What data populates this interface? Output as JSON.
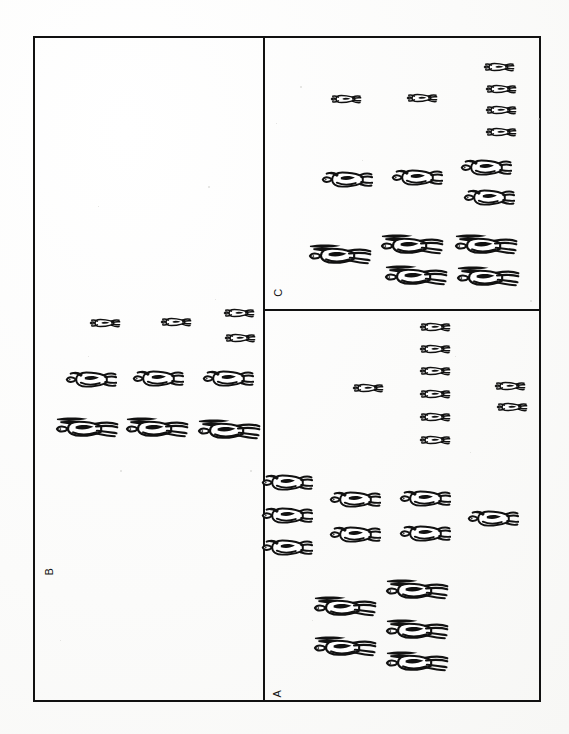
{
  "figure": {
    "background_color": "#fdfdfd",
    "ink_color": "#111111",
    "frame": {
      "x": 33,
      "y": 36,
      "width": 508,
      "height": 666,
      "stroke_width": 2
    },
    "dividers": [
      {
        "name": "vertical-divider",
        "orientation": "vertical",
        "x": 263,
        "y": 36,
        "length": 666
      },
      {
        "name": "horizontal-divider",
        "orientation": "horizontal",
        "x": 263,
        "y": 309,
        "length": 278
      }
    ]
  },
  "panels": [
    {
      "id": "B",
      "label": "B",
      "label_rotation": -90,
      "label_position": {
        "x": 46,
        "y": 566
      },
      "bounds": {
        "x": 33,
        "y": 36,
        "width": 230,
        "height": 666
      }
    },
    {
      "id": "C",
      "label": "C",
      "label_rotation": -90,
      "label_position": {
        "x": 274,
        "y": 287
      },
      "bounds": {
        "x": 263,
        "y": 36,
        "width": 278,
        "height": 273
      }
    },
    {
      "id": "A",
      "label": "A",
      "label_rotation": -90,
      "label_position": {
        "x": 274,
        "y": 688
      },
      "bounds": {
        "x": 263,
        "y": 309,
        "width": 278,
        "height": 393
      }
    }
  ],
  "size_classes": [
    {
      "name": "small",
      "description": "small juvenile hare, top view, short ears",
      "scale": 0.52
    },
    {
      "name": "medium",
      "description": "medium subadult hare, top view, rounded body",
      "scale": 0.82
    },
    {
      "name": "large",
      "description": "large adult hare, top view, long dark ears",
      "scale": 1.0
    }
  ],
  "animals": [
    {
      "panel": "C",
      "size": "small",
      "x": 345,
      "y": 99,
      "flip": false
    },
    {
      "panel": "C",
      "size": "small",
      "x": 421,
      "y": 98,
      "flip": false
    },
    {
      "panel": "C",
      "size": "small",
      "x": 498,
      "y": 67,
      "flip": false
    },
    {
      "panel": "C",
      "size": "small",
      "x": 500,
      "y": 89,
      "flip": false
    },
    {
      "panel": "C",
      "size": "small",
      "x": 500,
      "y": 110,
      "flip": false
    },
    {
      "panel": "C",
      "size": "small",
      "x": 500,
      "y": 132,
      "flip": false
    },
    {
      "panel": "C",
      "size": "medium",
      "x": 345,
      "y": 180,
      "flip": false
    },
    {
      "panel": "C",
      "size": "medium",
      "x": 415,
      "y": 178,
      "flip": false
    },
    {
      "panel": "C",
      "size": "medium",
      "x": 484,
      "y": 168,
      "flip": false
    },
    {
      "panel": "C",
      "size": "medium",
      "x": 487,
      "y": 198,
      "flip": false
    },
    {
      "panel": "C",
      "size": "large",
      "x": 338,
      "y": 253,
      "flip": false
    },
    {
      "panel": "C",
      "size": "large",
      "x": 410,
      "y": 243,
      "flip": false
    },
    {
      "panel": "C",
      "size": "large",
      "x": 414,
      "y": 274,
      "flip": false
    },
    {
      "panel": "C",
      "size": "large",
      "x": 484,
      "y": 243,
      "flip": false
    },
    {
      "panel": "C",
      "size": "large",
      "x": 486,
      "y": 275,
      "flip": false
    },
    {
      "panel": "A",
      "size": "small",
      "x": 434,
      "y": 327,
      "flip": false
    },
    {
      "panel": "A",
      "size": "small",
      "x": 434,
      "y": 349,
      "flip": false
    },
    {
      "panel": "A",
      "size": "small",
      "x": 434,
      "y": 371,
      "flip": false
    },
    {
      "panel": "A",
      "size": "small",
      "x": 434,
      "y": 394,
      "flip": false
    },
    {
      "panel": "A",
      "size": "small",
      "x": 434,
      "y": 417,
      "flip": false
    },
    {
      "panel": "A",
      "size": "small",
      "x": 434,
      "y": 440,
      "flip": false
    },
    {
      "panel": "A",
      "size": "small",
      "x": 367,
      "y": 388,
      "flip": false
    },
    {
      "panel": "A",
      "size": "small",
      "x": 509,
      "y": 386,
      "flip": false
    },
    {
      "panel": "A",
      "size": "small",
      "x": 511,
      "y": 407,
      "flip": false
    },
    {
      "panel": "A",
      "size": "medium",
      "x": 285,
      "y": 483,
      "flip": false
    },
    {
      "panel": "A",
      "size": "medium",
      "x": 285,
      "y": 516,
      "flip": false
    },
    {
      "panel": "A",
      "size": "medium",
      "x": 285,
      "y": 548,
      "flip": false
    },
    {
      "panel": "A",
      "size": "medium",
      "x": 353,
      "y": 500,
      "flip": false
    },
    {
      "panel": "A",
      "size": "medium",
      "x": 353,
      "y": 535,
      "flip": false
    },
    {
      "panel": "A",
      "size": "medium",
      "x": 423,
      "y": 499,
      "flip": false
    },
    {
      "panel": "A",
      "size": "medium",
      "x": 423,
      "y": 534,
      "flip": false
    },
    {
      "panel": "A",
      "size": "medium",
      "x": 491,
      "y": 519,
      "flip": false
    },
    {
      "panel": "A",
      "size": "large",
      "x": 343,
      "y": 605,
      "flip": false
    },
    {
      "panel": "A",
      "size": "large",
      "x": 343,
      "y": 645,
      "flip": false
    },
    {
      "panel": "A",
      "size": "large",
      "x": 415,
      "y": 588,
      "flip": false
    },
    {
      "panel": "A",
      "size": "large",
      "x": 415,
      "y": 628,
      "flip": false
    },
    {
      "panel": "A",
      "size": "large",
      "x": 415,
      "y": 660,
      "flip": false
    },
    {
      "panel": "B",
      "size": "small",
      "x": 104,
      "y": 323,
      "flip": false
    },
    {
      "panel": "B",
      "size": "small",
      "x": 175,
      "y": 322,
      "flip": false
    },
    {
      "panel": "B",
      "size": "small",
      "x": 238,
      "y": 313,
      "flip": false
    },
    {
      "panel": "B",
      "size": "small",
      "x": 239,
      "y": 338,
      "flip": false
    },
    {
      "panel": "B",
      "size": "medium",
      "x": 89,
      "y": 380,
      "flip": false
    },
    {
      "panel": "B",
      "size": "medium",
      "x": 156,
      "y": 379,
      "flip": false
    },
    {
      "panel": "B",
      "size": "medium",
      "x": 226,
      "y": 379,
      "flip": false
    },
    {
      "panel": "B",
      "size": "large",
      "x": 85,
      "y": 426,
      "flip": false
    },
    {
      "panel": "B",
      "size": "large",
      "x": 155,
      "y": 426,
      "flip": false
    },
    {
      "panel": "B",
      "size": "large",
      "x": 227,
      "y": 428,
      "flip": false
    }
  ]
}
